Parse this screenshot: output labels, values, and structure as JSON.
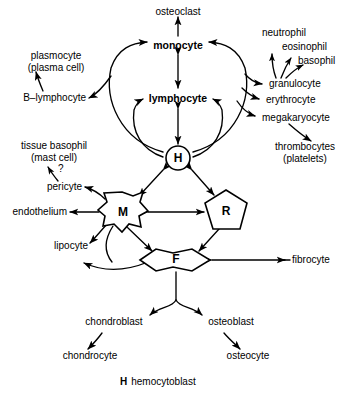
{
  "figure": {
    "type": "diagram"
  },
  "nodes": {
    "h": "H",
    "m": "M",
    "r": "R",
    "f": "F",
    "uncertainty_marker": "?"
  },
  "labels": {
    "osteoclast": "osteoclast",
    "monocyte": "monocyte",
    "lymphocyte": "lymphocyte",
    "neutrophil": "neutrophil",
    "eosinophil": "eosinophil",
    "basophil": "basophil",
    "granulocyte": "granulocyte",
    "erythrocyte": "erythrocyte",
    "megakaryocyte": "megakaryocyte",
    "thrombocytes_line1": "thrombocytes",
    "thrombocytes_line2": "(platelets)",
    "plasmocyte_line1": "plasmocyte",
    "plasmocyte_line2": "(plasma cell)",
    "b_lymphocyte": "B–lymphocyte",
    "tissue_basophil_line1": "tissue basophil",
    "tissue_basophil_line2": "(mast cell)",
    "pericyte": "pericyte",
    "endothelium": "endothelium",
    "lipocyte": "lipocyte",
    "fibrocyte": "fibrocyte",
    "chondroblast": "chondroblast",
    "osteoblast": "osteoblast",
    "chondrocyte": "chondrocyte",
    "osteocyte": "osteocyte"
  },
  "legend": {
    "key": "H",
    "text": "hemocytoblast"
  },
  "colors": {
    "ink": "#000000",
    "background": "#ffffff"
  }
}
